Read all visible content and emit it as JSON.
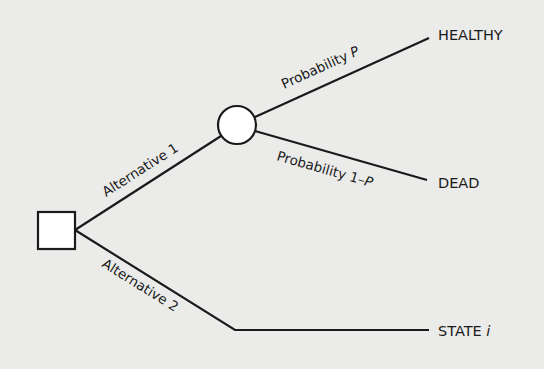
{
  "diagram": {
    "type": "decision-tree",
    "decision_node": {
      "shape": "square"
    },
    "chance_node": {
      "shape": "circle"
    },
    "branches": {
      "alt1": {
        "label": "Alternative 1"
      },
      "alt2": {
        "label": "Alternative 2"
      },
      "prob_p": {
        "label_prefix": "Probability ",
        "label_var": "P"
      },
      "prob_1mp": {
        "label_prefix": "Probability 1–",
        "label_var": "P"
      }
    },
    "outcomes": {
      "healthy": "HEALTHY",
      "dead": "DEAD",
      "state_prefix": "STATE ",
      "state_var": "i"
    },
    "colors": {
      "background": "#ebebea",
      "ink": "#1a1a1a",
      "node_fill": "#ffffff"
    }
  }
}
